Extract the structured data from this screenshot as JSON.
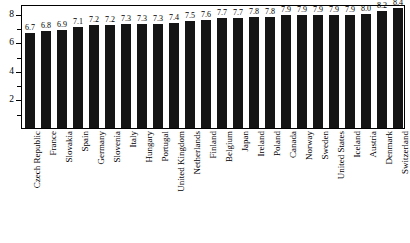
{
  "chart_data": {
    "type": "bar",
    "title": "",
    "subtitle": "",
    "xlabel": "",
    "ylabel": "",
    "ylim": [
      0,
      8.7
    ],
    "yticks": [
      2,
      4,
      6,
      8
    ],
    "ytick_labels": [
      "2",
      "4",
      "6",
      "8"
    ],
    "minor_yticks": [
      1,
      3,
      5,
      7
    ],
    "grid": false,
    "legend": null,
    "bar_color": "#151515",
    "background_color": "#ffffff",
    "axis_color": "#000000",
    "show_value_labels": true,
    "categories": [
      "Czech Republic",
      "France",
      "Slovakia",
      "Spain",
      "Germany",
      "Slovenia",
      "Italy",
      "Hungary",
      "Portugal",
      "United Kingdom",
      "Netherlands",
      "Finland",
      "Belgium",
      "Japan",
      "Ireland",
      "Poland",
      "Canada",
      "Norway",
      "Sweden",
      "United States",
      "Iceland",
      "Austria",
      "Denmark",
      "Switzerland"
    ],
    "values": [
      6.7,
      6.8,
      6.9,
      7.1,
      7.2,
      7.2,
      7.3,
      7.3,
      7.3,
      7.4,
      7.5,
      7.6,
      7.7,
      7.7,
      7.8,
      7.8,
      7.9,
      7.9,
      7.9,
      7.9,
      7.9,
      8.0,
      8.2,
      8.4
    ],
    "value_labels": [
      "6.7",
      "6.8",
      "6.9",
      "7.1",
      "7.2",
      "7.2",
      "7.3",
      "7.3",
      "7.3",
      "7.4",
      "7.5",
      "7.6",
      "7.7",
      "7.7",
      "7.8",
      "7.8",
      "7.9",
      "7.9",
      "7.9",
      "7.9",
      "7.9",
      "8.0",
      "8.2",
      "8.4"
    ]
  }
}
